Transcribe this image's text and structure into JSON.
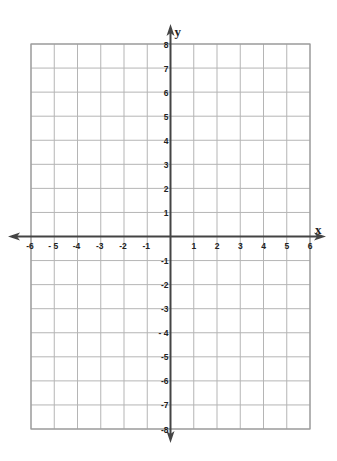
{
  "chart_data": {
    "type": "coordinate-grid",
    "title": "",
    "xlabel": "x",
    "ylabel": "y",
    "xlim": [
      -6,
      6
    ],
    "ylim": [
      -8,
      8
    ],
    "grid": true,
    "x_ticks": [
      "-6",
      "- 5",
      "-4",
      "-3",
      "-2",
      "-1",
      "1",
      "2",
      "3",
      "4",
      "5",
      "6"
    ],
    "x_tick_values": [
      -6,
      -5,
      -4,
      -3,
      -2,
      -1,
      1,
      2,
      3,
      4,
      5,
      6
    ],
    "y_ticks": [
      "8",
      "7",
      "6",
      "5",
      "4",
      "3",
      "2",
      "1",
      "-1",
      "-2",
      "-3",
      "- 4",
      "-5",
      "-6",
      "-7",
      "-8"
    ],
    "y_tick_values": [
      8,
      7,
      6,
      5,
      4,
      3,
      2,
      1,
      -1,
      -2,
      -3,
      -4,
      -5,
      -6,
      -7,
      -8
    ],
    "series": []
  },
  "colors": {
    "grid": "#b5b5b5",
    "border": "#9a9a9a",
    "axis": "#444444",
    "text": "#222222"
  },
  "geometry": {
    "left": 31,
    "right": 310,
    "top": 44,
    "bottom": 429
  }
}
